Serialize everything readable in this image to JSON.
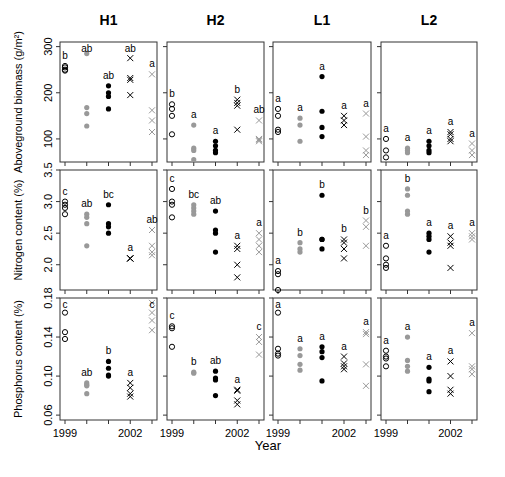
{
  "chart_data": {
    "type": "scatter",
    "layout": "3x4 panel grid",
    "columns": [
      "H1",
      "H2",
      "L1",
      "L2"
    ],
    "xlabel": "Year",
    "x_ticks": [
      1999,
      2000,
      2001,
      2002,
      2003
    ],
    "x_tick_labels": [
      "1999",
      "",
      "",
      "2002",
      ""
    ],
    "legend_encoding": {
      "1999": "open circle (black)",
      "2000": "filled circle (gray)",
      "2001": "filled circle (black)",
      "2002": "x (black)",
      "2003": "x (gray)"
    },
    "rows": [
      {
        "ylabel": "Aboveground biomass (g/m²)",
        "ylim": [
          50,
          310
        ],
        "y_ticks": [
          100,
          200,
          300
        ],
        "panels": {
          "H1": {
            "points": {
              "1999": [
                250,
                255,
                258,
                248
              ],
              "2000": [
                285,
                168,
                155,
                128
              ],
              "2001": [
                215,
                200,
                192,
                165
              ],
              "2002": [
                275,
                232,
                228,
                195
              ],
              "2003": [
                240,
                162,
                140,
                115
              ]
            },
            "letters": [
              "b",
              "ab",
              "ab",
              "ab",
              "a"
            ]
          },
          "H2": {
            "points": {
              "1999": [
                175,
                165,
                150,
                110
              ],
              "2000": [
                130,
                80,
                75,
                55
              ],
              "2001": [
                95,
                85,
                75,
                70
              ],
              "2002": [
                185,
                178,
                172,
                120
              ],
              "2003": [
                140,
                100,
                98,
                95
              ]
            },
            "letters": [
              "b",
              "a",
              "a",
              "b",
              "ab"
            ]
          },
          "L1": {
            "points": {
              "1999": [
                165,
                150,
                120,
                115
              ],
              "2000": [
                145,
                130,
                95
              ],
              "2001": [
                235,
                160,
                125,
                105
              ],
              "2002": [
                150,
                140,
                130
              ],
              "2003": [
                155,
                105,
                75,
                65
              ]
            },
            "letters": [
              "a",
              "a",
              "a",
              "a",
              "a"
            ]
          },
          "L2": {
            "points": {
              "1999": [
                100,
                75,
                60
              ],
              "2000": [
                80,
                75,
                70
              ],
              "2001": [
                95,
                85,
                75,
                70
              ],
              "2002": [
                115,
                110,
                100,
                95
              ],
              "2003": [
                90,
                75,
                65
              ]
            },
            "letters": [
              "a",
              "a",
              "a",
              "a",
              "a"
            ]
          }
        }
      },
      {
        "ylabel": "Nitrogen content (%)",
        "ylim": [
          1.6,
          3.5
        ],
        "y_ticks": [
          2.0,
          2.5,
          3.0,
          3.5
        ],
        "panels": {
          "H1": {
            "points": {
              "1999": [
                3.0,
                2.95,
                2.9,
                2.8
              ],
              "2000": [
                2.8,
                2.75,
                2.65,
                2.3
              ],
              "2001": [
                2.95,
                2.65,
                2.6,
                2.5
              ],
              "2002": [
                2.1,
                2.1,
                2.1
              ],
              "2003": [
                2.55,
                2.3,
                2.2,
                2.15
              ]
            },
            "letters": [
              "c",
              "ab",
              "bc",
              "a",
              "ab"
            ]
          },
          "H2": {
            "points": {
              "1999": [
                3.2,
                3.0,
                2.95,
                2.75
              ],
              "2000": [
                2.95,
                2.9,
                2.85,
                2.8
              ],
              "2001": [
                2.85,
                2.55,
                2.5,
                2.2
              ],
              "2002": [
                2.3,
                2.25,
                2.0,
                1.8
              ],
              "2003": [
                2.5,
                2.4,
                2.3,
                2.2
              ]
            },
            "letters": [
              "c",
              "bc",
              "ab",
              "a",
              "a"
            ]
          },
          "L1": {
            "points": {
              "1999": [
                1.9,
                1.85,
                1.6
              ],
              "2000": [
                2.35,
                2.25,
                2.2
              ],
              "2001": [
                3.1,
                2.4,
                2.4,
                2.25
              ],
              "2002": [
                2.4,
                2.35,
                2.25,
                2.1
              ],
              "2003": [
                2.7,
                2.6,
                2.3
              ]
            },
            "letters": [
              "a",
              "b",
              "b",
              "b",
              "b"
            ]
          },
          "L2": {
            "points": {
              "1999": [
                2.3,
                2.1,
                2.0,
                1.95
              ],
              "2000": [
                3.2,
                3.1,
                2.85,
                2.8
              ],
              "2001": [
                2.5,
                2.45,
                2.4,
                2.2
              ],
              "2002": [
                2.45,
                2.35,
                2.3,
                1.95
              ],
              "2003": [
                2.5,
                2.45,
                2.4
              ]
            },
            "letters": [
              "a",
              "b",
              "a",
              "a",
              "a"
            ]
          }
        }
      },
      {
        "ylabel": "Phosphorus content (%)",
        "ylim": [
          0.055,
          0.18
        ],
        "y_ticks": [
          0.06,
          0.1,
          0.14,
          0.18
        ],
        "panels": {
          "H1": {
            "points": {
              "1999": [
                0.165,
                0.145,
                0.138
              ],
              "2000": [
                0.093,
                0.091,
                0.09,
                0.082
              ],
              "2001": [
                0.115,
                0.108,
                0.101,
                0.1
              ],
              "2002": [
                0.093,
                0.088,
                0.082,
                0.079
              ],
              "2003": [
                0.175,
                0.165,
                0.157,
                0.147
              ]
            },
            "letters": [
              "c",
              "ab",
              "b",
              "a",
              "c"
            ]
          },
          "H2": {
            "points": {
              "1999": [
                0.151,
                0.149,
                0.13
              ],
              "2000": [
                0.104,
                0.103
              ],
              "2001": [
                0.105,
                0.098,
                0.096,
                0.08
              ],
              "2002": [
                0.086,
                0.085,
                0.075,
                0.071
              ],
              "2003": [
                0.14,
                0.135,
                0.122
              ]
            },
            "letters": [
              "c",
              "b",
              "ab",
              "a",
              "c"
            ]
          },
          "L1": {
            "points": {
              "1999": [
                0.165,
                0.128,
                0.123,
                0.121
              ],
              "2000": [
                0.128,
                0.121,
                0.112,
                0.106
              ],
              "2001": [
                0.13,
                0.125,
                0.119,
                0.095
              ],
              "2002": [
                0.12,
                0.113,
                0.11,
                0.107
              ],
              "2003": [
                0.145,
                0.143,
                0.112,
                0.09
              ]
            },
            "letters": [
              "a",
              "a",
              "a",
              "a",
              "a"
            ]
          },
          "L2": {
            "points": {
              "1999": [
                0.126,
                0.12,
                0.118,
                0.11
              ],
              "2000": [
                0.14,
                0.116,
                0.11,
                0.105
              ],
              "2001": [
                0.109,
                0.097,
                0.095,
                0.084
              ],
              "2002": [
                0.115,
                0.1,
                0.086,
                0.082
              ],
              "2003": [
                0.144,
                0.11,
                0.107,
                0.102
              ]
            },
            "letters": [
              "a",
              "a",
              "a",
              "a",
              "a"
            ]
          }
        }
      }
    ]
  }
}
